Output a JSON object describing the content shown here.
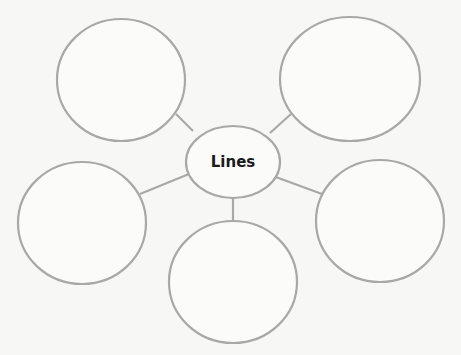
{
  "diagram": {
    "type": "bubble-map",
    "center": {
      "label": "Lines",
      "cx": 233,
      "cy": 162,
      "rx": 47,
      "ry": 36
    },
    "outer_bubbles": [
      {
        "id": "top-left",
        "cx": 121,
        "cy": 80,
        "rx": 64,
        "ry": 61,
        "label": ""
      },
      {
        "id": "top-right",
        "cx": 350,
        "cy": 79,
        "rx": 70,
        "ry": 62,
        "label": ""
      },
      {
        "id": "bottom-left",
        "cx": 82,
        "cy": 223,
        "rx": 64,
        "ry": 61,
        "label": ""
      },
      {
        "id": "bottom-middle",
        "cx": 233,
        "cy": 282,
        "rx": 64,
        "ry": 61,
        "label": ""
      },
      {
        "id": "bottom-right",
        "cx": 380,
        "cy": 221,
        "rx": 64,
        "ry": 61,
        "label": ""
      }
    ],
    "colors": {
      "stroke": "#a8a8a8",
      "background": "#f7f7f5",
      "text": "#1a1a1a"
    }
  }
}
